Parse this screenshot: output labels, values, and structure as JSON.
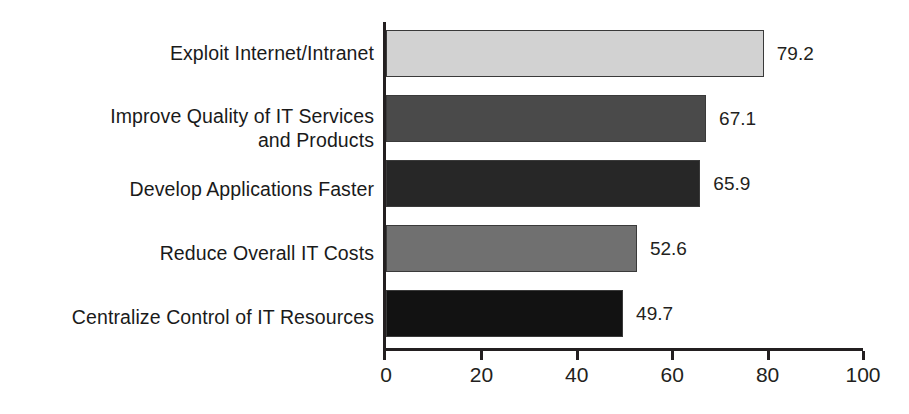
{
  "chart_data": {
    "type": "bar",
    "orientation": "horizontal",
    "title": "",
    "subtitle": "",
    "xlabel": "",
    "ylabel": "",
    "xlim": [
      0,
      100
    ],
    "xticks": [
      0,
      20,
      40,
      60,
      80,
      100
    ],
    "xtick_labels": [
      "0",
      "20",
      "40",
      "60",
      "80",
      "100"
    ],
    "grid": false,
    "legend": false,
    "categories": [
      "Exploit Internet/Intranet",
      "Improve Quality of IT Services\nand Products",
      "Develop Applications Faster",
      "Reduce Overall IT Costs",
      "Centralize Control of IT Resources"
    ],
    "values": [
      79.2,
      67.1,
      65.9,
      52.6,
      49.7
    ],
    "value_labels": [
      "79.2",
      "67.1",
      "65.9",
      "52.6",
      "49.7"
    ],
    "bar_colors": [
      "#d2d2d2",
      "#4a4a4a",
      "#272727",
      "#707070",
      "#121212"
    ],
    "bar_outline_color": "#3a3a3a",
    "axis_color": "#231f20",
    "text_color": "#231f20",
    "background_color": "#ffffff"
  }
}
